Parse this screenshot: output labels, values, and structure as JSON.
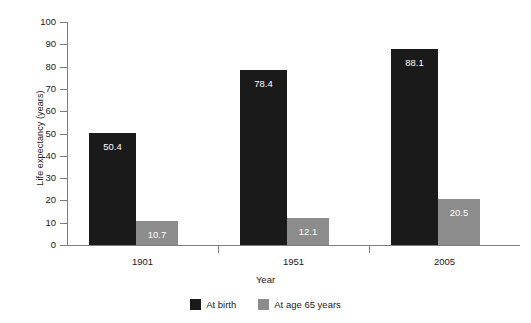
{
  "chart_data": {
    "type": "bar",
    "title": "",
    "xlabel": "Year",
    "ylabel": "Life expectancy (years)",
    "categories": [
      "1901",
      "1951",
      "2005"
    ],
    "ylim": [
      0,
      100
    ],
    "yticks": [
      0,
      10,
      20,
      30,
      40,
      50,
      60,
      70,
      80,
      90,
      100
    ],
    "ytick_labels": [
      "0",
      "10",
      "20",
      "30",
      "40",
      "50",
      "60",
      "70",
      "80",
      "90",
      "100"
    ],
    "grid": false,
    "legend_position": "bottom-center",
    "series": [
      {
        "name": "At birth",
        "color": "#1a1a1a",
        "values": [
          50.4,
          78.4,
          88.1
        ],
        "value_labels": [
          "50.4",
          "78.4",
          "88.1"
        ]
      },
      {
        "name": "At age 65 years",
        "color": "#8c8c8c",
        "values": [
          10.7,
          12.1,
          20.5
        ],
        "value_labels": [
          "10.7",
          "12.1",
          "20.5"
        ]
      }
    ]
  },
  "legend": {
    "items": [
      {
        "label": "At birth",
        "color": "#1a1a1a"
      },
      {
        "label": "At age 65 years",
        "color": "#8c8c8c"
      }
    ]
  },
  "axes": {
    "y_title": "Life expectancy (years)",
    "x_title": "Year"
  }
}
